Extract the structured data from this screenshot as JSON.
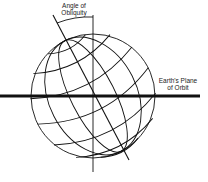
{
  "figure": {
    "labels": {
      "angle_of_obliquity_line1": "Angle of",
      "angle_of_obliquity_line2": "Obliquity",
      "plane_of_orbit_line1": "Earth's Plane",
      "plane_of_orbit_line2": "of Orbit"
    },
    "axial_tilt_degrees": 23.5,
    "colors": {
      "stroke": "#111111",
      "background": "#ffffff"
    }
  }
}
